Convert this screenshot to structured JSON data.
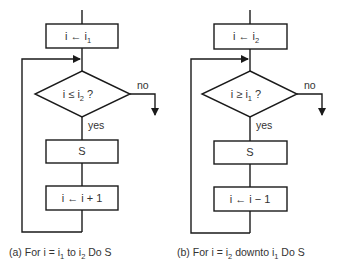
{
  "diagram": {
    "type": "flowchart-pair",
    "charts": [
      {
        "id": "a",
        "init_box": {
          "text": "i ← i",
          "sub": "1"
        },
        "decision": {
          "text": "i ≤ i",
          "sub": "2",
          "suffix": " ?"
        },
        "no_label": "no",
        "yes_label": "yes",
        "body_box": {
          "text": "S"
        },
        "update_box": {
          "text": "i ← i + 1"
        },
        "caption": {
          "prefix": "(a) For i = i",
          "s1": "1",
          "mid": " to i",
          "s2": "2",
          "suffix": " Do S"
        }
      },
      {
        "id": "b",
        "init_box": {
          "text": "i ← i",
          "sub": "2"
        },
        "decision": {
          "text": "i ≥ i",
          "sub": "1",
          "suffix": " ?"
        },
        "no_label": "no",
        "yes_label": "yes",
        "body_box": {
          "text": "S"
        },
        "update_box": {
          "text": "i ← i − 1"
        },
        "caption": {
          "prefix": "(b) For i = i",
          "s1": "2",
          "mid": " downto i",
          "s2": "1",
          "suffix": " Do S"
        }
      }
    ]
  }
}
